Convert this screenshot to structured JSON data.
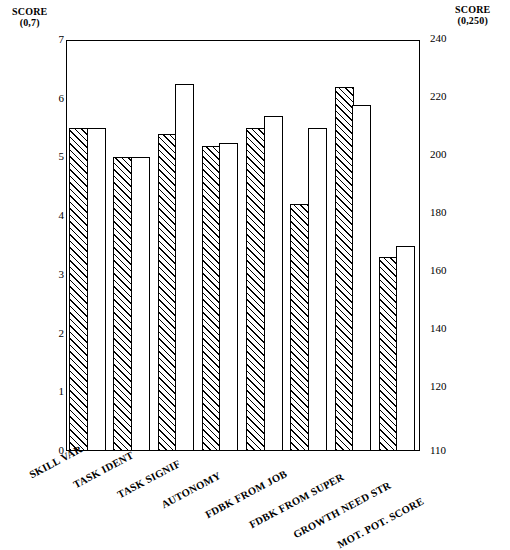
{
  "chart_data": {
    "type": "bar",
    "title": "",
    "subtitle": "",
    "orientation": "vertical",
    "grid": false,
    "legend_position": "none",
    "categories": [
      "SKILL VAR",
      "TASK IDENT",
      "TASK SIGNIF",
      "AUTONOMY",
      "FDBK FROM JOB",
      "FDBK FROM SUPER",
      "GROWTH NEED STR",
      "MOT. POT. SCORE"
    ],
    "series": [
      {
        "name": "hatched",
        "fill": "diagonal-hatch",
        "values": [
          5.5,
          5.0,
          5.4,
          5.2,
          5.5,
          4.2,
          6.2,
          3.3
        ]
      },
      {
        "name": "white",
        "fill": "solid-white",
        "values": [
          5.5,
          5.0,
          6.25,
          5.25,
          5.7,
          5.5,
          5.9,
          3.5
        ]
      }
    ],
    "axes": {
      "left": {
        "label": "SCORE",
        "range_label": "(0,7)",
        "ticks": [
          "0",
          "1",
          "2",
          "3",
          "4",
          "5",
          "6",
          "7"
        ],
        "ylim": [
          0,
          7
        ],
        "applies_to_categories": [
          "SKILL VAR",
          "TASK IDENT",
          "TASK SIGNIF",
          "AUTONOMY",
          "FDBK FROM JOB",
          "FDBK FROM SUPER",
          "GROWTH NEED STR"
        ]
      },
      "right": {
        "label": "SCORE",
        "range_label": "(0,250)",
        "ticks": [
          "110",
          "120",
          "140",
          "160",
          "180",
          "200",
          "220",
          "240"
        ],
        "ylim": [
          110,
          240
        ],
        "applies_to_categories": [
          "MOT. POT. SCORE"
        ],
        "values_right_scale": {
          "hatched": 163,
          "white": 169
        }
      }
    },
    "xlabel": "",
    "ylabel": "SCORE"
  },
  "colors": {
    "ink": "#000000",
    "paper": "#ffffff"
  }
}
